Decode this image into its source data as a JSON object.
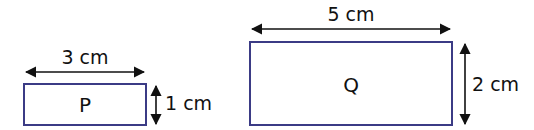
{
  "diagram": {
    "type": "rectangles-with-dimensions",
    "stroke_color": "#3b3b85",
    "arrow_color": "#111111",
    "shapes": [
      {
        "label": "P",
        "width_label": "3 cm",
        "height_label": "1 cm"
      },
      {
        "label": "Q",
        "width_label": "5 cm",
        "height_label": "2 cm"
      }
    ]
  }
}
